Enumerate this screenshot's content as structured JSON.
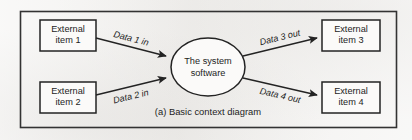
{
  "figure": {
    "caption": "(a) Basic context diagram",
    "process": {
      "label_line1": "The system",
      "label_line2": "software"
    },
    "entities": [
      {
        "id": "external-item-1",
        "line1": "External",
        "line2": "item 1"
      },
      {
        "id": "external-item-2",
        "line1": "External",
        "line2": "item 2"
      },
      {
        "id": "external-item-3",
        "line1": "External",
        "line2": "item 3"
      },
      {
        "id": "external-item-4",
        "line1": "External",
        "line2": "item 4"
      }
    ],
    "flows": [
      {
        "id": "data-1-in",
        "label": "Data 1 in",
        "direction": "in"
      },
      {
        "id": "data-2-in",
        "label": "Data 2 in",
        "direction": "in"
      },
      {
        "id": "data-3-out",
        "label": "Data 3 out",
        "direction": "out"
      },
      {
        "id": "data-4-out",
        "label": "Data 4 out",
        "direction": "out"
      }
    ],
    "colors": {
      "ink": "#232323",
      "paper": "#f2f1ef",
      "shape_fill": "#fbfaf9"
    }
  }
}
